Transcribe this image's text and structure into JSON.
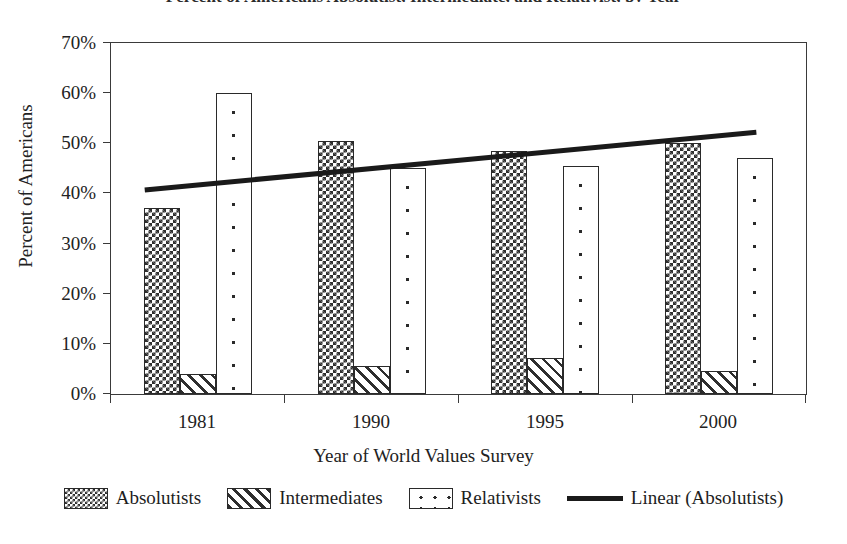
{
  "chart_data": {
    "type": "bar",
    "title": "Percent of Americans Absolutist, Intermediate, and Relativist, by Year",
    "xlabel": "Year of World Values Survey",
    "ylabel": "Percent of Americans",
    "categories": [
      "1981",
      "1990",
      "1995",
      "2000"
    ],
    "ylim": [
      0,
      70
    ],
    "ytick_labels": [
      "0%",
      "10%",
      "20%",
      "30%",
      "40%",
      "50%",
      "60%",
      "70%"
    ],
    "ytick_values": [
      0,
      10,
      20,
      30,
      40,
      50,
      60,
      70
    ],
    "grid": false,
    "legend_position": "bottom",
    "series": [
      {
        "name": "Absolutists",
        "pattern": "checker",
        "values": [
          37.0,
          50.5,
          48.5,
          50.0
        ]
      },
      {
        "name": "Intermediates",
        "pattern": "diagonal",
        "values": [
          4.0,
          5.5,
          7.2,
          4.5
        ]
      },
      {
        "name": "Relativists",
        "pattern": "dots",
        "values": [
          60.0,
          45.0,
          45.5,
          47.0
        ]
      }
    ],
    "trendline": {
      "name": "Linear (Absolutists)",
      "style": "solid",
      "start": {
        "x_category": "1981",
        "value": 40.5
      },
      "end": {
        "x_category": "2000",
        "value": 52.0
      }
    }
  },
  "legend": {
    "items": [
      {
        "label": "Absolutists"
      },
      {
        "label": "Intermediates"
      },
      {
        "label": "Relativists"
      },
      {
        "label": "Linear (Absolutists)"
      }
    ]
  },
  "colors": {
    "ink": "#2a2a2a",
    "axis": "#3a3a3a",
    "background": "#ffffff",
    "trendline": "#1a1a1a"
  }
}
